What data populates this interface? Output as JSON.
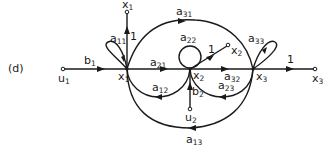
{
  "figure_label": "(d)",
  "nodes": {
    "u1": {
      "name": "u",
      "sub": "1"
    },
    "x1": {
      "name": "x",
      "sub": "1"
    },
    "x2": {
      "name": "x",
      "sub": "2"
    },
    "x3": {
      "name": "x",
      "sub": "3"
    },
    "x1_out": {
      "name": "x",
      "sub": "1"
    },
    "x2_out": {
      "name": "x",
      "sub": "2"
    },
    "x3_out": {
      "name": "x",
      "sub": "3"
    },
    "u2": {
      "name": "u",
      "sub": "2"
    }
  },
  "edges": {
    "b1": {
      "name": "b",
      "sub": "1"
    },
    "b2": {
      "name": "b",
      "sub": "2"
    },
    "a11": {
      "name": "a",
      "sub": "11"
    },
    "a22": {
      "name": "a",
      "sub": "22"
    },
    "a33": {
      "name": "a",
      "sub": "33"
    },
    "a21": {
      "name": "a",
      "sub": "21"
    },
    "a32": {
      "name": "a",
      "sub": "32"
    },
    "a12": {
      "name": "a",
      "sub": "12"
    },
    "a23": {
      "name": "a",
      "sub": "23"
    },
    "a31": {
      "name": "a",
      "sub": "31"
    },
    "a13": {
      "name": "a",
      "sub": "13"
    },
    "one_x1": "1",
    "one_x2": "1",
    "one_x3": "1"
  },
  "colors": {
    "stroke": "#1a1a1a",
    "background": "#ffffff"
  }
}
